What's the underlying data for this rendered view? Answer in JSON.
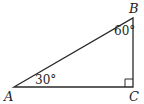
{
  "figure": {
    "type": "right-triangle",
    "stroke_color": "#2a2a2a",
    "background": "#ffffff",
    "vertices": [
      {
        "name": "A",
        "x": 14,
        "y": 87,
        "label": "A"
      },
      {
        "name": "B",
        "x": 133,
        "y": 18,
        "label": "B"
      },
      {
        "name": "C",
        "x": 133,
        "y": 87,
        "label": "C"
      }
    ],
    "angles": [
      {
        "vertex": "A",
        "label": "30°"
      },
      {
        "vertex": "B",
        "label": "60°"
      },
      {
        "vertex": "C",
        "label": "",
        "right_angle": true
      }
    ]
  }
}
